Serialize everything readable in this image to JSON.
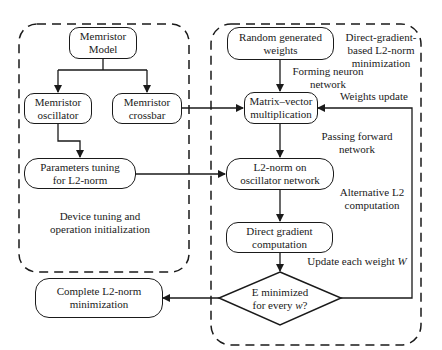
{
  "regions": {
    "left": {
      "label_line1": "Device tuning and",
      "label_line2": "operation initialization"
    },
    "right": {
      "label_line1": "Direct-gradient-",
      "label_line2": "based L2-norm",
      "label_line3": "minimization"
    }
  },
  "boxes": {
    "memristor_model": {
      "line1": "Memristor",
      "line2": "Model"
    },
    "memristor_oscillator": {
      "line1": "Memristor",
      "line2": "oscillator"
    },
    "memristor_crossbar": {
      "line1": "Memristor",
      "line2": "crossbar"
    },
    "parameters_tuning": {
      "line1": "Parameters tuning",
      "line2": "for L2-norm"
    },
    "random_weights": {
      "line1": "Random generated",
      "line2": "weights"
    },
    "matrix_vector": {
      "line1": "Matrix–vector",
      "line2": "multiplication"
    },
    "l2_norm_oscillator": {
      "line1": "L2-norm on",
      "line2": "oscillator network"
    },
    "direct_gradient": {
      "line1": "Direct gradient",
      "line2": "computation"
    },
    "complete_l2": {
      "line1": "Complete L2-norm",
      "line2": "minimization"
    }
  },
  "decision": {
    "line1": "E minimized",
    "line2_prefix": "for every ",
    "line2_var": "w",
    "line2_suffix": "?"
  },
  "edge_labels": {
    "forming": {
      "line1": "Forming neuron",
      "line2": "network"
    },
    "passing": {
      "line1": "Passing forward",
      "line2": "network"
    },
    "alternative": {
      "line1": "Alternative L2",
      "line2": "computation"
    },
    "update_each_prefix": "Update each weight ",
    "update_each_var": "W",
    "weights_update": "Weights update"
  }
}
